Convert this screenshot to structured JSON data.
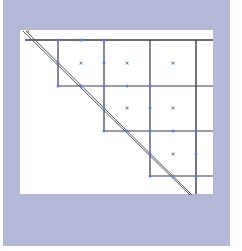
{
  "diagram": {
    "type": "staircase-grid-with-diagonal",
    "colors": {
      "background": "#b3b8d6",
      "canvas": "#ffffff",
      "grid_line": "#3a3a4a",
      "anchor_point": "#5a7fd0",
      "diagonal": "#55555f"
    },
    "rows": [
      {
        "cells": [
          {
            "col": 0,
            "mark": "×"
          },
          {
            "col": 1,
            "mark": "×"
          },
          {
            "col": 2,
            "mark": "×"
          }
        ]
      },
      {
        "cells": [
          {
            "col": 1,
            "mark": "×"
          },
          {
            "col": 2,
            "mark": "×"
          }
        ]
      },
      {
        "cells": [
          {
            "col": 2,
            "mark": "×"
          }
        ]
      }
    ],
    "corner_label": "×"
  }
}
